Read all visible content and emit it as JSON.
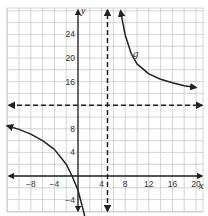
{
  "chart_data": {
    "type": "line",
    "title": "",
    "xlabel": "x",
    "ylabel": "y",
    "xlim": [
      -12,
      21
    ],
    "ylim": [
      -6,
      28
    ],
    "grid": true,
    "grid_step": 2,
    "x_ticks": [
      -8,
      -4,
      4,
      8,
      12,
      16,
      20
    ],
    "x_tick_labels": [
      "−8",
      "−4",
      "4",
      "8",
      "12",
      "16",
      "20"
    ],
    "y_ticks": [
      -4,
      4,
      8,
      16,
      20,
      24
    ],
    "y_tick_labels": [
      "−4",
      "4",
      "8",
      "16",
      "20",
      "24"
    ],
    "asymptotes": {
      "vertical": 5,
      "horizontal": 12
    },
    "function_label": "g",
    "series": [
      {
        "name": "g (left branch)",
        "x": [
          -12,
          -10,
          -8,
          -6,
          -4,
          -2,
          -1,
          0,
          1,
          1.8
        ],
        "y": [
          8.5,
          7.9,
          7.1,
          6.0,
          4.5,
          2.0,
          0.0,
          -2.4,
          -6.2,
          -10
        ]
      },
      {
        "name": "g (right branch)",
        "x": [
          7.2,
          8,
          9,
          10,
          12,
          14,
          16,
          18,
          20
        ],
        "y": [
          28,
          23.9,
          20.8,
          19.0,
          17.3,
          16.4,
          15.8,
          15.3,
          15.0
        ]
      }
    ]
  },
  "labels": {
    "x_axis": "x",
    "y_axis": "y",
    "function": "g"
  }
}
